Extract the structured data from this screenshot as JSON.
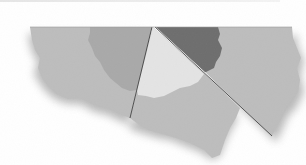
{
  "figure": {
    "colors": {
      "background": "#ffffff",
      "paper": "#bdbdbd",
      "medium_region": "#a9a9a9",
      "light_region": "#e4e4e4",
      "dark_region": "#6e6e6e",
      "cut_line": "#333333",
      "shadow": "#8a8a8a"
    },
    "pieces": [
      {
        "name": "left-piece",
        "shade": "paper"
      },
      {
        "name": "middle-wedge",
        "shade": "paper"
      },
      {
        "name": "right-piece",
        "shade": "paper"
      }
    ],
    "regions": [
      {
        "name": "medium-region",
        "shade": "medium_region"
      },
      {
        "name": "light-region",
        "shade": "light_region"
      },
      {
        "name": "dark-region",
        "shade": "dark_region"
      }
    ]
  }
}
